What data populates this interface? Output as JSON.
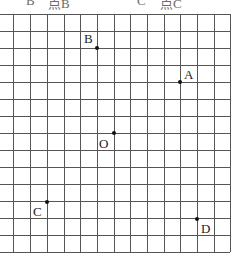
{
  "header": {
    "options": [
      {
        "letter": "B",
        "text": "点B"
      },
      {
        "letter": "C",
        "text": "点C"
      }
    ]
  },
  "grid": {
    "columns": 13,
    "rows": 14,
    "line_color": "#555555"
  },
  "points": [
    {
      "name": "A",
      "label": "A"
    },
    {
      "name": "B",
      "label": "B"
    },
    {
      "name": "O",
      "label": "O"
    },
    {
      "name": "C",
      "label": "C"
    },
    {
      "name": "D",
      "label": "D"
    }
  ]
}
